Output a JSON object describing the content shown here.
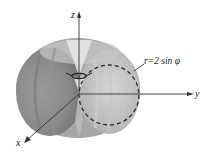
{
  "figure": {
    "surface_equation": "r=2 sin φ",
    "axes": {
      "x_label": "x",
      "y_label": "y",
      "z_label": "z"
    },
    "colors": {
      "surface_light": "#d8d8d8",
      "surface_mid": "#a8a8a8",
      "surface_dark": "#7a7a7a",
      "axis": "#333333",
      "dashed_circle": "#2a2a2a"
    }
  }
}
